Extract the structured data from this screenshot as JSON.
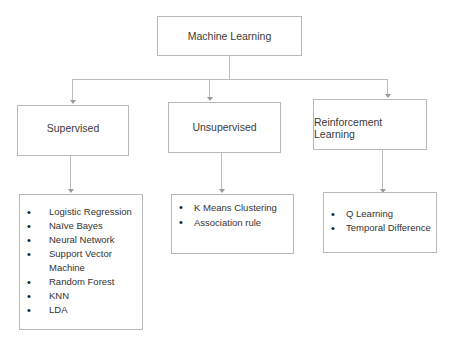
{
  "root": {
    "label": "Machine Learning"
  },
  "categories": [
    {
      "label": "Supervised",
      "items": [
        "Logistic Regression",
        "Naïve Bayes",
        "Neural Network",
        "Support Vector Machine",
        "Random Forest",
        "KNN",
        "LDA"
      ]
    },
    {
      "label": "Unsupervised",
      "items": [
        "K Means Clustering",
        "Association rule"
      ]
    },
    {
      "label": "Reinforcement Learning",
      "items": [
        "Q Learning",
        "Temporal Difference"
      ]
    }
  ],
  "colors": {
    "border": "#b8b8b8",
    "connector": "#bdbdbd",
    "text": "#333333"
  }
}
